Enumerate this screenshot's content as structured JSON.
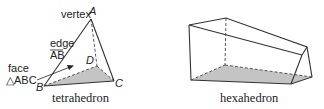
{
  "figures": [
    {
      "name": "tetrahedron",
      "caption": "tetrahedron",
      "labels": {
        "vertex": "vertex",
        "vertex_A": "A",
        "edge": "edge",
        "edge_name": "AB",
        "face": "face",
        "face_name": "△ABC",
        "B": "B",
        "C": "C",
        "D": "D"
      }
    },
    {
      "name": "hexahedron",
      "caption": "hexahedron"
    }
  ],
  "colors": {
    "line": "#333333",
    "shade": "#c4c4c4",
    "text": "#222222"
  }
}
